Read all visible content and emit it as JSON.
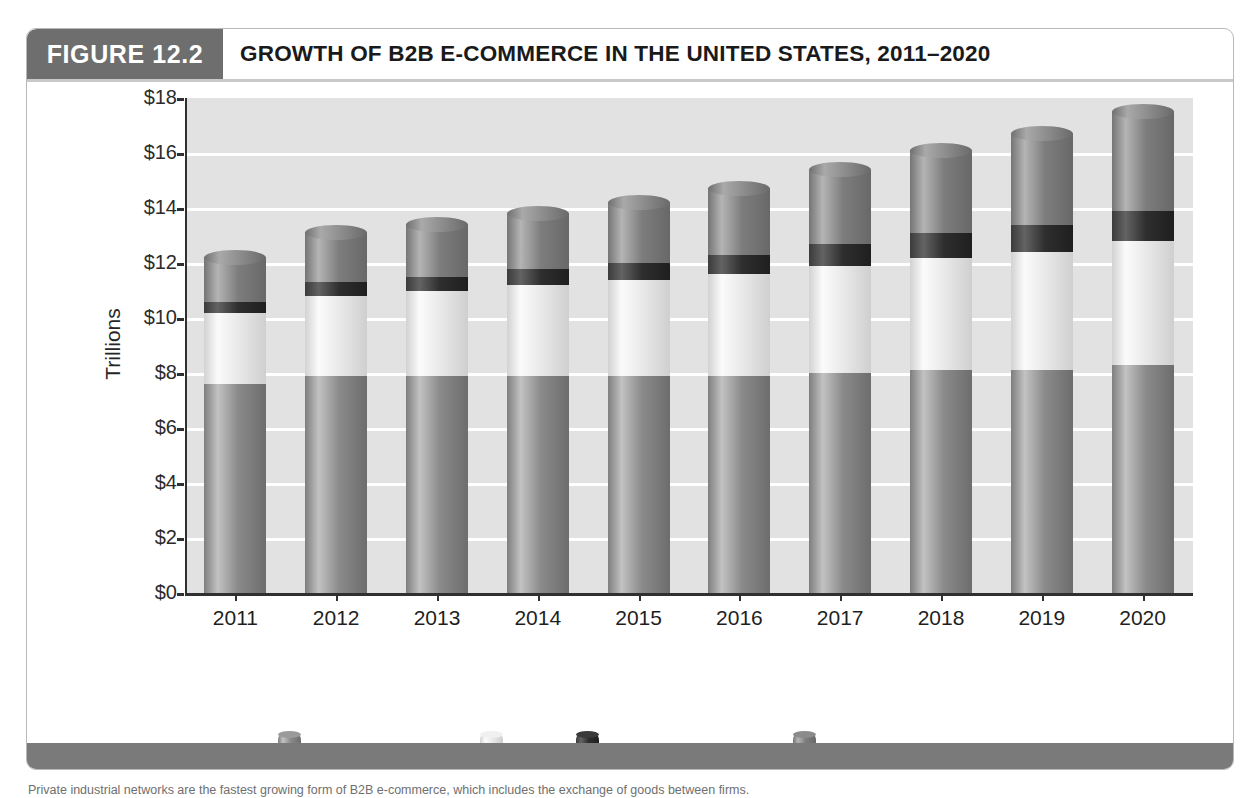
{
  "figure": {
    "tag": "FIGURE 12.2",
    "title": "GROWTH OF B2B E-COMMERCE IN THE UNITED STATES, 2011–2020",
    "caption": "Private industrial networks are the fastest growing form of B2B e-commerce, which includes the exchange of goods between firms."
  },
  "colors": {
    "tag_bg": "#6e6e6e",
    "plot_bg": "#e2e2e2",
    "gridline": "#ffffff",
    "axis": "#303030",
    "traditional_b2b": "#8c8c8c",
    "edi": "#eaeaea",
    "b2b_net_markets": "#2f2f2f",
    "private_networks": "#7f7f7f",
    "footer_bar": "#7a7a7a"
  },
  "chart_data": {
    "type": "bar",
    "stacked": true,
    "title": "GROWTH OF B2B E-COMMERCE IN THE UNITED STATES, 2011–2020",
    "xlabel": "",
    "ylabel": "Trillions",
    "ylim": [
      0,
      18
    ],
    "yticks": [
      0,
      2,
      4,
      6,
      8,
      10,
      12,
      14,
      16,
      18
    ],
    "ytick_labels": [
      "$0",
      "$2",
      "$4",
      "$6",
      "$8",
      "$10",
      "$12",
      "$14",
      "$16",
      "$18"
    ],
    "grid": true,
    "legend_position": "bottom",
    "categories": [
      "2011",
      "2012",
      "2013",
      "2014",
      "2015",
      "2016",
      "2017",
      "2018",
      "2019",
      "2020"
    ],
    "series": [
      {
        "name": "Traditional B2B",
        "color": "#8c8c8c",
        "values": [
          7.6,
          7.9,
          7.9,
          7.9,
          7.9,
          7.9,
          8.0,
          8.1,
          8.1,
          8.3
        ]
      },
      {
        "name": "EDI",
        "color": "#eaeaea",
        "values": [
          2.6,
          2.9,
          3.1,
          3.3,
          3.5,
          3.7,
          3.9,
          4.1,
          4.3,
          4.5
        ]
      },
      {
        "name": "B2B Net Markets",
        "color": "#2f2f2f",
        "values": [
          0.4,
          0.5,
          0.5,
          0.6,
          0.6,
          0.7,
          0.8,
          0.9,
          1.0,
          1.1
        ]
      },
      {
        "name": "Private Networks",
        "color": "#7f7f7f",
        "values": [
          1.6,
          1.8,
          1.9,
          2.0,
          2.2,
          2.4,
          2.7,
          3.0,
          3.3,
          3.6
        ]
      }
    ],
    "totals": [
      12.2,
      13.1,
      13.4,
      13.8,
      14.2,
      14.7,
      15.4,
      16.1,
      16.7,
      17.5
    ]
  }
}
